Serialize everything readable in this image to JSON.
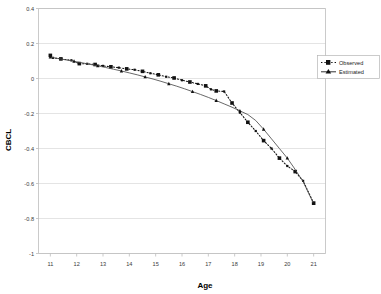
{
  "chart_data": {
    "type": "line",
    "title": "",
    "xlabel": "Age",
    "ylabel": "CBCL",
    "xlim": [
      10.55,
      21.45
    ],
    "ylim": [
      -1.0,
      0.4
    ],
    "grid": true,
    "legend_position": "top-right",
    "x_ticks": [
      "11",
      "12",
      "13",
      "14",
      "15",
      "16",
      "17",
      "18",
      "19",
      "20",
      "21"
    ],
    "y_ticks": [
      "0.4",
      "0.2",
      "0",
      "-0.2",
      "-0.4",
      "-0.6",
      "-0.8",
      "-1"
    ],
    "x_tick_values": [
      11,
      12,
      13,
      14,
      15,
      16,
      17,
      18,
      19,
      20,
      21
    ],
    "y_tick_values": [
      0.4,
      0.2,
      0,
      -0.2,
      -0.4,
      -0.6,
      -0.8,
      -1
    ],
    "series": [
      {
        "name": "Observed",
        "style": "dotted",
        "marker": "square",
        "color": "#111111",
        "x": [
          11.0,
          11.1,
          11.4,
          11.8,
          12.1,
          12.4,
          12.7,
          13.0,
          13.3,
          13.6,
          13.9,
          14.2,
          14.5,
          14.8,
          15.1,
          15.4,
          15.7,
          16.0,
          16.3,
          16.6,
          16.9,
          17.1,
          17.3,
          17.6,
          17.9,
          18.2,
          18.5,
          18.8,
          19.1,
          19.4,
          19.7,
          20.0,
          20.3,
          20.6,
          21.0
        ],
        "y": [
          0.132,
          0.118,
          0.112,
          0.104,
          0.085,
          0.084,
          0.08,
          0.072,
          0.067,
          0.062,
          0.055,
          0.05,
          0.041,
          0.03,
          0.021,
          0.01,
          0.003,
          -0.01,
          -0.02,
          -0.031,
          -0.042,
          -0.062,
          -0.071,
          -0.074,
          -0.14,
          -0.195,
          -0.25,
          -0.3,
          -0.355,
          -0.4,
          -0.455,
          -0.5,
          -0.532,
          -0.585,
          -0.712
        ]
      },
      {
        "name": "Estimated",
        "style": "solid",
        "marker": "triangle",
        "color": "#4d4d4d",
        "x": [
          11.0,
          11.3,
          11.6,
          11.9,
          12.2,
          12.5,
          12.8,
          13.1,
          13.4,
          13.7,
          14.0,
          14.3,
          14.6,
          14.9,
          15.2,
          15.5,
          15.8,
          16.1,
          16.4,
          16.7,
          17.0,
          17.3,
          17.6,
          17.9,
          18.2,
          18.5,
          18.8,
          19.1,
          19.4,
          19.7,
          20.0,
          20.3,
          20.6,
          21.0
        ],
        "y": [
          0.122,
          0.114,
          0.106,
          0.098,
          0.09,
          0.081,
          0.072,
          0.063,
          0.053,
          0.043,
          0.032,
          0.021,
          0.009,
          -0.003,
          -0.016,
          -0.03,
          -0.044,
          -0.059,
          -0.075,
          -0.091,
          -0.108,
          -0.126,
          -0.145,
          -0.164,
          -0.185,
          -0.206,
          -0.24,
          -0.29,
          -0.345,
          -0.4,
          -0.455,
          -0.52,
          -0.59,
          -0.715
        ]
      }
    ]
  },
  "legend": {
    "items": [
      {
        "label": "Observed"
      },
      {
        "label": "Estimated"
      }
    ]
  },
  "axes": {
    "x_title": "Age",
    "y_title": "CBCL"
  }
}
